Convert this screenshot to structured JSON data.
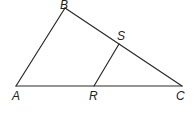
{
  "figure": {
    "type": "triangle",
    "points": {
      "A": {
        "label": "A",
        "x": 16,
        "y": 86
      },
      "B": {
        "label": "B",
        "x": 65,
        "y": 8
      },
      "C": {
        "label": "C",
        "x": 182,
        "y": 86
      },
      "R": {
        "label": "R",
        "x": 94,
        "y": 86
      },
      "S": {
        "label": "S",
        "x": 119,
        "y": 44
      }
    },
    "segments": [
      "AB",
      "BC",
      "AC",
      "RS"
    ],
    "colors": {
      "line": "#2a2a2a",
      "label": "#222222",
      "background": "#ffffff"
    }
  }
}
